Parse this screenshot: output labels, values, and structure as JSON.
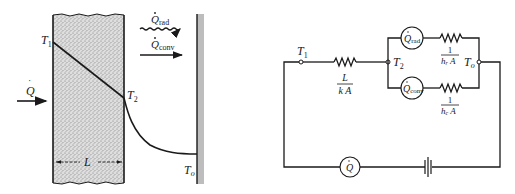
{
  "left_figure": {
    "title": "Wall with conduction, radiation and convection",
    "heat_in": {
      "symbol": "Q",
      "dot": "˙"
    },
    "labels": {
      "T1": {
        "main": "T",
        "sub": "1"
      },
      "T2": {
        "main": "T",
        "sub": "2"
      },
      "To": {
        "main": "T",
        "sub": "o"
      },
      "L": "L"
    },
    "q_rad": {
      "main": "Q",
      "sub": "rad"
    },
    "q_conv": {
      "main": "Q",
      "sub": "conv"
    }
  },
  "right_figure": {
    "title": "Equivalent thermal circuit",
    "nodes": {
      "T1": {
        "main": "T",
        "sub": "1"
      },
      "T2": {
        "main": "T",
        "sub": "2"
      },
      "To": {
        "main": "T",
        "sub": "o"
      }
    },
    "conduction_resistance": {
      "numerator": "L",
      "denominator": "k A"
    },
    "radiation_resistance": {
      "numerator": "1",
      "denominator_main": "h",
      "denominator_sub": "r",
      "denominator_tail": " A"
    },
    "convection_resistance": {
      "numerator": "1",
      "denominator_main": "h",
      "denominator_sub": "c",
      "denominator_tail": " A"
    },
    "q_rad_source": {
      "main": "Q",
      "sub": "rad"
    },
    "q_conv_source": {
      "main": "Q",
      "sub": "conv"
    },
    "q_source": {
      "main": "Q"
    }
  },
  "colors": {
    "ink": "#1a1a1a",
    "slab_fill": "#d4d4d4",
    "wall_shade": "#b8b8b8"
  }
}
